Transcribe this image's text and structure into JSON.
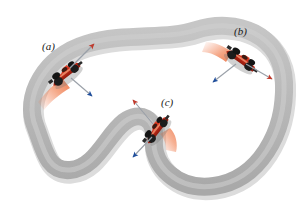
{
  "figure": {
    "type": "physics-diagram",
    "background_color": "#ffffff",
    "width": 304,
    "height": 210
  },
  "track": {
    "name": "racetrack-band",
    "fill_color": "#b8b8b8",
    "edge_color": "#9a9a9a",
    "shadow_color": "#d8d8d8",
    "band_width": 18,
    "shape": "closed-loop-with-left-hairpin-and-central-s-curve"
  },
  "labels": [
    {
      "id": "a",
      "text": "(a)",
      "color": "#1a1a1a"
    },
    {
      "id": "b",
      "text": "(b)",
      "color": "#1a1a1a"
    },
    {
      "id": "c",
      "text": "(c)",
      "color": "#1a1a1a"
    }
  ],
  "colors": {
    "velocity_arrow": "#c0392b",
    "acceleration_arrow": "#1f4e9c",
    "arrow_shaft": "#808893",
    "car_body": "#cc2a17",
    "car_body_dark": "#8e1c0f",
    "car_highlight": "#f07a50",
    "car_wheel": "#1c1c1c",
    "motion_blur": "#f08050",
    "track_gray": "#b8b8b8"
  },
  "cars": [
    {
      "id": "car-a",
      "label": "(a)",
      "position": {
        "x": 66,
        "y": 74
      },
      "heading_deg": -38,
      "velocity_arrow": {
        "from": [
          72,
          68
        ],
        "to": [
          94,
          44
        ],
        "color": "#c0392b"
      },
      "acceleration_arrow": {
        "from": [
          72,
          78
        ],
        "to": [
          92,
          96
        ],
        "color": "#1f4e9c"
      }
    },
    {
      "id": "car-b",
      "label": "(b)",
      "position": {
        "x": 241,
        "y": 60
      },
      "heading_deg": 35,
      "velocity_arrow": {
        "from": [
          246,
          64
        ],
        "to": [
          272,
          78
        ],
        "color": "#c0392b"
      },
      "acceleration_arrow": {
        "from": [
          236,
          64
        ],
        "to": [
          214,
          82
        ],
        "color": "#1f4e9c"
      }
    },
    {
      "id": "car-c",
      "label": "(c)",
      "position": {
        "x": 157,
        "y": 130
      },
      "heading_deg": -52,
      "velocity_arrow": {
        "from": [
          152,
          124
        ],
        "to": [
          134,
          100
        ],
        "color": "#c0392b"
      },
      "acceleration_arrow": {
        "from": [
          152,
          136
        ],
        "to": [
          134,
          156
        ],
        "color": "#1f4e9c"
      }
    }
  ]
}
